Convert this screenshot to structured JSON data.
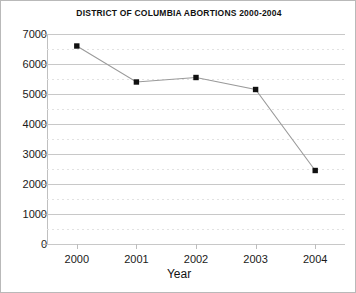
{
  "chart_data": {
    "type": "line",
    "title": "DISTRICT OF COLUMBIA ABORTIONS 2000-2004",
    "xlabel": "Year",
    "ylabel": "",
    "categories": [
      "2000",
      "2001",
      "2002",
      "2003",
      "2004"
    ],
    "values": [
      6600,
      5400,
      5550,
      5150,
      2450
    ],
    "series": [
      {
        "name": "District of Columbia abortions",
        "values": [
          6600,
          5400,
          5550,
          5150,
          2450
        ]
      }
    ],
    "ylim": [
      0,
      7000
    ],
    "ytick_labels": [
      "0",
      "1000",
      "2000",
      "3000",
      "4000",
      "5000",
      "6000",
      "7000"
    ],
    "ytick_values": [
      0,
      1000,
      2000,
      3000,
      4000,
      5000,
      6000,
      7000
    ],
    "ytick_step": 1000,
    "minor_gridline_step": 500,
    "grid": "major-solid-and-minor-dotted",
    "legend": "none",
    "marker": "square",
    "marker_color": "#101010",
    "line_color": "#9a9a9a",
    "grid_color": "#c8c8c8",
    "minor_grid_color": "#e2e2e2"
  },
  "axes": {
    "x_title": "Year"
  }
}
